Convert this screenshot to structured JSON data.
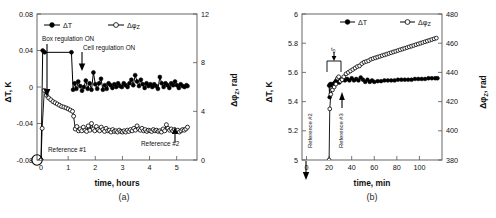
{
  "figure": {
    "panel_a_caption": "(a)",
    "panel_b_caption": "(b)"
  },
  "chart_data": [
    {
      "type": "line",
      "panel": "(a)",
      "title": "",
      "xlabel": "time, hours",
      "ylabel": "ΔT, K",
      "y2label": "ΔφZ, rad",
      "xlim": [
        -0.15,
        5.75
      ],
      "ylim": [
        -0.08,
        0.08
      ],
      "y2lim": [
        0,
        12
      ],
      "xticks": [
        0,
        1,
        2,
        3,
        4,
        5
      ],
      "xticklabels": [
        "0",
        "1",
        "2",
        "3",
        "4",
        "5"
      ],
      "yticks": [
        -0.08,
        -0.04,
        0,
        0.04,
        0.08
      ],
      "yticklabels": [
        "-0.08",
        "-0.04",
        "0",
        "0.04",
        "0.08"
      ],
      "y2ticks": [
        0,
        4,
        8,
        12
      ],
      "y2ticklabels": [
        "0",
        "4",
        "8",
        "12"
      ],
      "grid": false,
      "legend_position": "top-inside",
      "legend": [
        "ΔT",
        "ΔφZ"
      ],
      "annotations": [
        {
          "text": "Box regulation ON",
          "x": 0.15,
          "y": 0.056
        },
        {
          "text": "Cell regulation ON",
          "x": 1.28,
          "y": 0.04
        },
        {
          "text": "Reference #1",
          "x": 0.22,
          "y": -0.073
        },
        {
          "text": "Reference #2",
          "x": 3.85,
          "y": -0.07
        }
      ],
      "series": [
        {
          "name": "ΔT",
          "axis": "left",
          "marker": "filled-circle",
          "x": [
            0.0,
            0.06,
            0.13,
            1.12,
            1.18,
            1.24,
            1.3,
            1.37,
            1.44,
            1.51,
            1.58,
            1.65,
            1.72,
            1.79,
            1.86,
            1.93,
            2.0,
            2.07,
            2.14,
            2.21,
            2.28,
            2.35,
            2.42,
            2.49,
            2.56,
            2.63,
            2.7,
            2.77,
            2.84,
            2.91,
            2.98,
            3.05,
            3.12,
            3.19,
            3.26,
            3.33,
            3.4,
            3.47,
            3.54,
            3.61,
            3.68,
            3.75,
            3.82,
            3.89,
            3.96,
            4.03,
            4.1,
            4.17,
            4.24,
            4.31,
            4.38,
            4.45,
            4.52,
            4.59,
            4.66,
            4.73,
            4.8,
            4.87,
            4.94,
            5.01,
            5.08,
            5.15,
            5.22,
            5.29,
            5.36,
            5.4
          ],
          "y": [
            -0.08,
            0.04,
            0.038,
            0.038,
            -0.003,
            0.004,
            -0.002,
            0.006,
            0.001,
            -0.004,
            0.0,
            0.007,
            -0.002,
            0.004,
            -0.003,
            0.016,
            0.003,
            -0.002,
            0.004,
            0.009,
            -0.003,
            0.002,
            -0.002,
            0.004,
            0.002,
            -0.001,
            0.003,
            0.0,
            0.004,
            0.001,
            0.0,
            0.004,
            0.002,
            0.0,
            0.004,
            0.008,
            0.002,
            0.013,
            0.006,
            0.001,
            0.008,
            0.003,
            -0.001,
            0.004,
            0.001,
            0.003,
            0.0,
            0.003,
            0.001,
            -0.002,
            0.011,
            0.004,
            0.0,
            0.004,
            0.002,
            -0.001,
            0.004,
            0.002,
            0.006,
            0.002,
            -0.001,
            0.003,
            0.001,
            0.0,
            0.002,
            0.001
          ]
        },
        {
          "name": "ΔφZ",
          "axis": "right",
          "marker": "open-circle",
          "x": [
            0.0,
            0.04,
            0.12,
            0.2,
            0.28,
            0.36,
            0.44,
            0.52,
            0.6,
            0.68,
            0.76,
            0.84,
            0.92,
            1.0,
            1.08,
            1.16,
            1.2,
            1.26,
            1.32,
            1.38,
            1.44,
            1.5,
            1.56,
            1.62,
            1.68,
            1.74,
            1.8,
            1.86,
            1.92,
            1.98,
            2.04,
            2.1,
            2.16,
            2.22,
            2.28,
            2.34,
            2.4,
            2.46,
            2.52,
            2.58,
            2.64,
            2.7,
            2.76,
            2.82,
            2.88,
            2.94,
            3.0,
            3.06,
            3.12,
            3.18,
            3.24,
            3.3,
            3.36,
            3.42,
            3.48,
            3.54,
            3.6,
            3.66,
            3.72,
            3.78,
            3.84,
            3.9,
            3.96,
            4.02,
            4.08,
            4.14,
            4.2,
            4.26,
            4.32,
            4.38,
            4.44,
            4.5,
            4.56,
            4.62,
            4.68,
            4.74,
            4.8,
            4.86,
            4.92,
            4.98,
            5.04,
            5.1,
            5.16,
            5.22,
            5.28,
            5.34,
            5.4
          ],
          "y": [
            0.0,
            2.6,
            5.72,
            5.32,
            5.1,
            4.95,
            4.8,
            4.7,
            4.6,
            4.5,
            4.4,
            4.35,
            4.28,
            4.2,
            4.1,
            4.0,
            3.6,
            2.55,
            2.75,
            2.4,
            2.55,
            2.4,
            2.7,
            2.45,
            2.35,
            2.8,
            2.45,
            3.0,
            2.55,
            2.4,
            2.75,
            2.5,
            2.4,
            2.7,
            2.5,
            2.35,
            2.6,
            2.4,
            2.45,
            2.3,
            2.5,
            2.35,
            2.4,
            2.3,
            2.45,
            2.35,
            2.3,
            2.4,
            2.3,
            2.45,
            2.35,
            2.5,
            2.4,
            2.6,
            2.45,
            2.8,
            2.55,
            2.45,
            2.6,
            2.4,
            2.5,
            2.35,
            2.45,
            2.4,
            2.35,
            2.5,
            2.4,
            2.45,
            2.35,
            2.4,
            2.3,
            2.55,
            2.4,
            2.9,
            2.6,
            2.45,
            2.55,
            2.4,
            2.5,
            2.35,
            2.45,
            2.3,
            2.4,
            2.5,
            2.45,
            2.55,
            2.7
          ]
        }
      ]
    },
    {
      "type": "line",
      "panel": "(b)",
      "title": "",
      "xlabel": "time, min",
      "ylabel": "ΔT, K",
      "y2label": "ΔφZ, rad",
      "xlim": [
        -4,
        120
      ],
      "ylim": [
        5,
        6
      ],
      "y2lim": [
        380,
        480
      ],
      "xticks": [
        0,
        20,
        40,
        60,
        80,
        100
      ],
      "xticklabels": [
        "0",
        "20",
        "40",
        "60",
        "80",
        "100"
      ],
      "yticks": [
        5,
        5.2,
        5.4,
        5.6,
        5.8,
        6
      ],
      "yticklabels": [
        "5",
        "5.2",
        "5.4",
        "5.6",
        "5.8",
        "6"
      ],
      "y2ticks": [
        380,
        400,
        420,
        440,
        460,
        480
      ],
      "y2ticklabels": [
        "380",
        "400",
        "420",
        "440",
        "460",
        "480"
      ],
      "grid": false,
      "legend_position": "top-inside",
      "legend": [
        "ΔT",
        "ΔφZ"
      ],
      "annotations": [
        {
          "text": "Reference #2",
          "x": 2,
          "y": 5.08,
          "rotated": true
        },
        {
          "text": "Reference #3",
          "x": 29,
          "y": 5.08,
          "rotated": true
        },
        {
          "text": "t0",
          "x": 24,
          "y": 5.7
        }
      ],
      "series": [
        {
          "name": "ΔT",
          "axis": "left",
          "marker": "filled-circle",
          "x": [
            20,
            20.5,
            21,
            22,
            23,
            24,
            25,
            26,
            27,
            28,
            29,
            30,
            31,
            32,
            34,
            36,
            38,
            40,
            42,
            44,
            46,
            48,
            50,
            52,
            54,
            56,
            58,
            60,
            63,
            66,
            69,
            72,
            75,
            78,
            81,
            84,
            87,
            90,
            93,
            96,
            99,
            102,
            105,
            108,
            111,
            114,
            116
          ],
          "y": [
            5.51,
            5.43,
            5.52,
            5.52,
            5.51,
            5.52,
            5.53,
            5.54,
            5.55,
            5.54,
            5.53,
            5.545,
            5.55,
            5.55,
            5.545,
            5.555,
            5.545,
            5.56,
            5.545,
            5.555,
            5.545,
            5.565,
            5.55,
            5.535,
            5.55,
            5.535,
            5.545,
            5.535,
            5.54,
            5.54,
            5.545,
            5.545,
            5.545,
            5.545,
            5.55,
            5.55,
            5.55,
            5.55,
            5.55,
            5.555,
            5.555,
            5.555,
            5.555,
            5.56,
            5.56,
            5.56,
            5.56
          ]
        },
        {
          "name": "ΔφZ",
          "axis": "right",
          "marker": "open-circle",
          "x": [
            20,
            20.6,
            21.5,
            23,
            24.5,
            26,
            27.5,
            28.5,
            30,
            31.5,
            33,
            35,
            37,
            39,
            41,
            43,
            45,
            47,
            49,
            51,
            53,
            55,
            57,
            59,
            61,
            63,
            65,
            67,
            69,
            71,
            73,
            75,
            77,
            79,
            81,
            83,
            85,
            87,
            89,
            91,
            93,
            95,
            97,
            99,
            101,
            103,
            105,
            107,
            109,
            111,
            113,
            115
          ],
          "y": [
            380,
            415,
            425,
            428,
            430,
            432,
            436,
            437,
            434,
            435,
            437,
            439,
            440,
            441,
            442,
            443,
            444,
            444.5,
            446,
            447,
            447.5,
            448,
            449,
            449.5,
            450,
            450.5,
            451,
            451.5,
            452,
            452.5,
            453,
            453.5,
            454,
            454.5,
            455,
            455.5,
            456,
            456.5,
            457,
            457.5,
            458,
            458.5,
            459,
            459.5,
            460,
            460.5,
            461,
            461.5,
            462,
            462.5,
            463,
            463.5
          ]
        }
      ]
    }
  ]
}
